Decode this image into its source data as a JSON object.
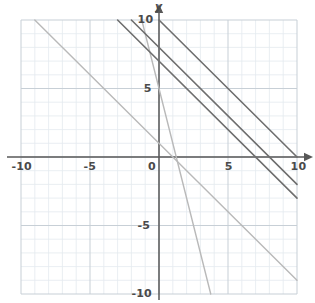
{
  "chart_data": {
    "type": "line",
    "title": "",
    "xlabel": "x",
    "ylabel": "y",
    "xlim": [
      -10,
      10
    ],
    "ylim": [
      -10,
      10
    ],
    "grid": true,
    "grid_major_step": 5,
    "grid_minor_step": 1,
    "legend": "none",
    "x_ticks": [
      -10,
      -5,
      0,
      5,
      10
    ],
    "x_tick_labels": [
      "-10",
      "-5",
      "0",
      "5",
      "10"
    ],
    "y_ticks": [
      -10,
      -5,
      5,
      10
    ],
    "y_tick_labels": [
      "-10",
      "-5",
      "5",
      "10"
    ],
    "origin_label": "0",
    "series": [
      {
        "name": "line-1",
        "equation": "y = -x + 1",
        "slope": -1,
        "intercept": 1,
        "color": "#b9b9b9",
        "width": 1.4,
        "x": [
          -9,
          10
        ],
        "y": [
          10,
          -9
        ]
      },
      {
        "name": "line-2",
        "equation": "y = -4x + 5",
        "slope": -4,
        "intercept": 5,
        "color": "#b9b9b9",
        "width": 1.4,
        "x": [
          -1.25,
          3.75
        ],
        "y": [
          10,
          -10
        ]
      },
      {
        "name": "line-3",
        "equation": "y = -x + 7",
        "slope": -1,
        "intercept": 7,
        "color": "#6e6e6e",
        "width": 1.6,
        "x": [
          -3,
          10
        ],
        "y": [
          10,
          -3
        ]
      },
      {
        "name": "line-4",
        "equation": "y = -x + 8",
        "slope": -1,
        "intercept": 8,
        "color": "#6e6e6e",
        "width": 1.6,
        "x": [
          -2,
          10
        ],
        "y": [
          10,
          -2
        ]
      },
      {
        "name": "line-5",
        "equation": "y = -x + 10",
        "slope": -1,
        "intercept": 10,
        "color": "#6e6e6e",
        "width": 1.6,
        "x": [
          0,
          10
        ],
        "y": [
          10,
          0
        ]
      }
    ],
    "colors": {
      "axis": "#585858",
      "grid_major": "#c7cfd6",
      "grid_minor": "#e4eaef",
      "text": "#4a4a4a",
      "background": "#ffffff"
    }
  }
}
